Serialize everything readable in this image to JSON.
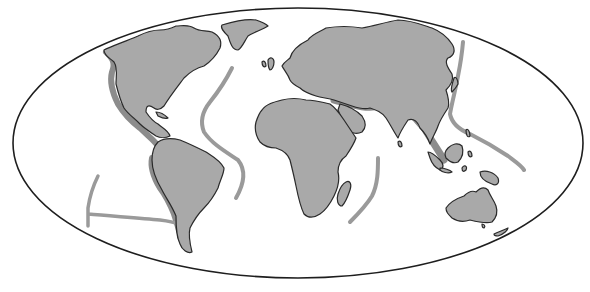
{
  "map": {
    "projection": "elliptical-world",
    "colors": {
      "ocean": "#ffffff",
      "land": "#a9a9a9",
      "coastline": "#2a2a2a",
      "mountain_belt": "#8c8c8c",
      "ridge": "#9a9a9a",
      "frame": "#1e1e1e"
    },
    "landmasses": [
      "north-america",
      "greenland",
      "south-america",
      "europe-asia",
      "africa",
      "madagascar",
      "arabia",
      "india",
      "southeast-asia",
      "japan",
      "indonesia",
      "philippines",
      "new-guinea",
      "australia",
      "new-zealand",
      "british-isles",
      "sri-lanka",
      "cuba"
    ],
    "features": [
      "american-cordillera",
      "andes",
      "mid-atlantic-ridge",
      "alpine-himalayan-belt",
      "western-pacific-arc",
      "east-pacific-rise",
      "southwest-indian-ridge"
    ]
  }
}
